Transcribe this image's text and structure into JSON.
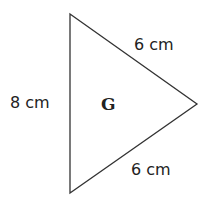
{
  "diagram": {
    "shape": "triangle",
    "name": "G",
    "sides": [
      {
        "id": "left",
        "label": "8 cm"
      },
      {
        "id": "upper-right",
        "label": "6 cm"
      },
      {
        "id": "lower-right",
        "label": "6 cm"
      }
    ],
    "colors": {
      "stroke": "#333333",
      "fill": "#ffffff",
      "text": "#222222"
    }
  }
}
